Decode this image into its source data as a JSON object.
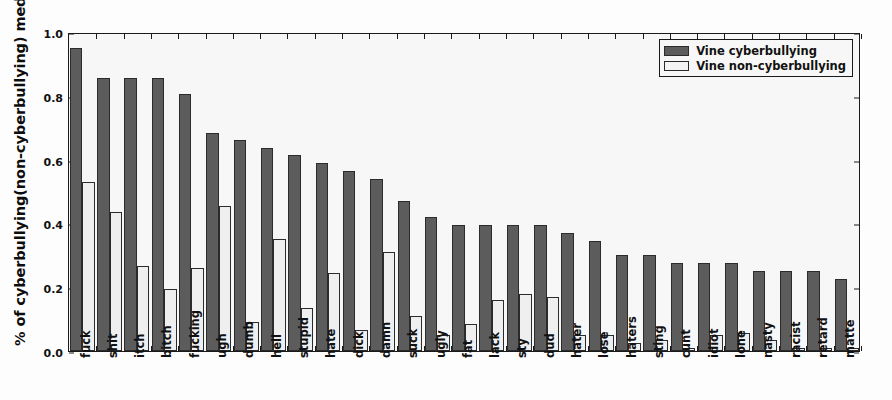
{
  "chart_data": {
    "type": "bar",
    "title": "",
    "xlabel": "",
    "ylabel": "% of cyberbullying(non-cyberbullying) media",
    "ylim": [
      0.0,
      1.0
    ],
    "yticks": [
      "0.0",
      "0.2",
      "0.4",
      "0.6",
      "0.8",
      "1.0"
    ],
    "ytick_values": [
      0.0,
      0.2,
      0.4,
      0.6,
      0.8,
      1.0
    ],
    "grid": false,
    "legend_position": "upper right",
    "categories": [
      "fuck",
      "shit",
      "itch",
      "bitch",
      "fucking",
      "ugh",
      "dumb",
      "hell",
      "stupid",
      "hate",
      "dick",
      "damn",
      "suck",
      "ugly",
      "fat",
      "lack",
      "sty",
      "dud",
      "hater",
      "lose",
      "haters",
      "sting",
      "cunt",
      "idiot",
      "lone",
      "nasty",
      "racist",
      "retard",
      "matte"
    ],
    "series": [
      {
        "name": "Vine cyberbullying",
        "color": "#5c5c5c",
        "values": [
          0.95,
          0.855,
          0.855,
          0.855,
          0.805,
          0.685,
          0.66,
          0.635,
          0.615,
          0.59,
          0.565,
          0.54,
          0.47,
          0.42,
          0.395,
          0.395,
          0.395,
          0.395,
          0.37,
          0.345,
          0.3,
          0.3,
          0.275,
          0.275,
          0.275,
          0.25,
          0.25,
          0.25,
          0.225
        ]
      },
      {
        "name": "Vine non-cyberbullying",
        "color": "#efefef",
        "values": [
          0.53,
          0.435,
          0.265,
          0.195,
          0.26,
          0.455,
          0.09,
          0.35,
          0.135,
          0.245,
          0.065,
          0.31,
          0.11,
          0.05,
          0.085,
          0.16,
          0.18,
          0.17,
          0.05,
          0.05,
          0.025,
          0.035,
          0.01,
          0.05,
          0.055,
          0.035,
          0.01,
          0.01,
          0.008
        ]
      }
    ]
  },
  "legend": {
    "items": [
      {
        "label": "Vine cyberbullying",
        "swatch": "cb"
      },
      {
        "label": "Vine non-cyberbullying",
        "swatch": "ncb"
      }
    ]
  },
  "colors": {
    "cyberbullying_bar": "#5c5c5c",
    "non_cyberbullying_bar": "#efefef",
    "axis": "#1a1a1a",
    "plot_background": "#f7f7f7",
    "figure_background": "#fdfdfd"
  }
}
